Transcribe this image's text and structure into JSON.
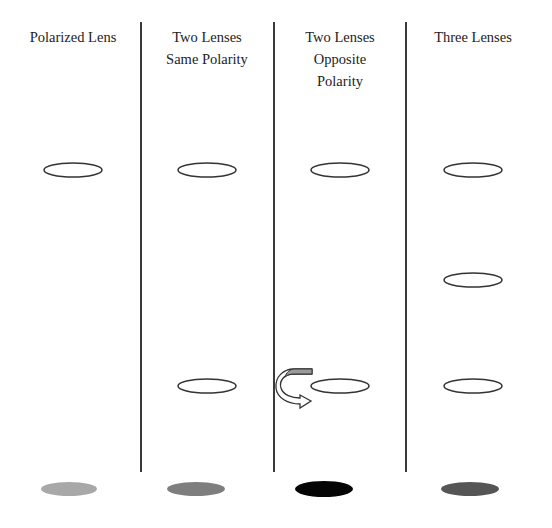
{
  "columns": [
    {
      "title_lines": [
        "Polarized Lens"
      ],
      "center_x": 73,
      "lens_y": [
        170
      ],
      "result_color": "#a8a8a8",
      "rotation_arrow": false
    },
    {
      "title_lines": [
        "Two Lenses",
        "Same Polarity"
      ],
      "center_x": 207,
      "lens_y": [
        170,
        386
      ],
      "result_color": "#7e7e7e",
      "rotation_arrow": false
    },
    {
      "title_lines": [
        "Two Lenses",
        "Opposite",
        "Polarity"
      ],
      "center_x": 340,
      "lens_y": [
        170,
        386
      ],
      "result_color": "#050505",
      "rotation_arrow": true
    },
    {
      "title_lines": [
        "Three Lenses"
      ],
      "center_x": 473,
      "lens_y": [
        170,
        280,
        386
      ],
      "result_color": "#555555",
      "rotation_arrow": false
    }
  ],
  "dividers_x": [
    141,
    274,
    406
  ],
  "colors": {
    "lens_outline": "#333333",
    "divider": "#3a3a3a",
    "arrow_fill": "#9a9a9a",
    "text": "#222222"
  },
  "result_ellipse_y": 489
}
